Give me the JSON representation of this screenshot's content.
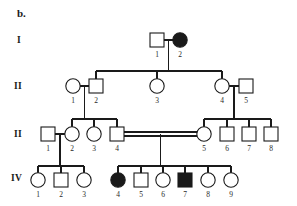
{
  "figure": {
    "panel_label": "b.",
    "type": "pedigree-chart",
    "colors": {
      "affected_fill": "#1a1a1a",
      "unaffected_fill": "#ffffff",
      "line": "#1a1a1a",
      "background": "#ffffff"
    }
  },
  "generations": [
    {
      "label": "I",
      "label_x": 17,
      "label_y": 43
    },
    {
      "label": "II",
      "label_x": 14,
      "label_y": 88
    },
    {
      "label": "II",
      "label_x": 14,
      "label_y": 136
    },
    {
      "label": "IV",
      "label_x": 12,
      "label_y": 180
    }
  ],
  "individuals": [
    {
      "id": "I-1",
      "number": "1",
      "sex": "male",
      "affected": false,
      "cx": 157,
      "cy": 40
    },
    {
      "id": "I-2",
      "number": "2",
      "sex": "female",
      "affected": true,
      "cx": 180,
      "cy": 40
    },
    {
      "id": "II-1",
      "number": "1",
      "sex": "female",
      "affected": false,
      "cx": 73,
      "cy": 86
    },
    {
      "id": "II-2",
      "number": "2",
      "sex": "male",
      "affected": false,
      "cx": 96,
      "cy": 86
    },
    {
      "id": "II-3",
      "number": "3",
      "sex": "female",
      "affected": false,
      "cx": 157,
      "cy": 86
    },
    {
      "id": "II-4",
      "number": "4",
      "sex": "female",
      "affected": false,
      "cx": 222,
      "cy": 86
    },
    {
      "id": "II-5",
      "number": "5",
      "sex": "male",
      "affected": false,
      "cx": 246,
      "cy": 86
    },
    {
      "id": "III-1",
      "number": "1",
      "sex": "male",
      "affected": false,
      "cx": 48,
      "cy": 134
    },
    {
      "id": "III-2",
      "number": "2",
      "sex": "female",
      "affected": false,
      "cx": 72,
      "cy": 134
    },
    {
      "id": "III-3",
      "number": "3",
      "sex": "female",
      "affected": false,
      "cx": 94,
      "cy": 134
    },
    {
      "id": "III-4",
      "number": "4",
      "sex": "male",
      "affected": false,
      "cx": 117,
      "cy": 134
    },
    {
      "id": "III-5",
      "number": "5",
      "sex": "female",
      "affected": false,
      "cx": 204,
      "cy": 134
    },
    {
      "id": "III-6",
      "number": "6",
      "sex": "male",
      "affected": false,
      "cx": 227,
      "cy": 134
    },
    {
      "id": "III-7",
      "number": "7",
      "sex": "male",
      "affected": false,
      "cx": 249,
      "cy": 134
    },
    {
      "id": "III-8",
      "number": "8",
      "sex": "male",
      "affected": false,
      "cx": 271,
      "cy": 134
    },
    {
      "id": "IV-1",
      "number": "1",
      "sex": "female",
      "affected": false,
      "cx": 38,
      "cy": 180
    },
    {
      "id": "IV-2",
      "number": "2",
      "sex": "male",
      "affected": false,
      "cx": 61,
      "cy": 180
    },
    {
      "id": "IV-3",
      "number": "3",
      "sex": "female",
      "affected": false,
      "cx": 84,
      "cy": 180
    },
    {
      "id": "IV-4",
      "number": "4",
      "sex": "female",
      "affected": true,
      "cx": 118,
      "cy": 180
    },
    {
      "id": "IV-5",
      "number": "5",
      "sex": "male",
      "affected": false,
      "cx": 141,
      "cy": 180
    },
    {
      "id": "IV-6",
      "number": "6",
      "sex": "female",
      "affected": false,
      "cx": 163,
      "cy": 180
    },
    {
      "id": "IV-7",
      "number": "7",
      "sex": "male",
      "affected": true,
      "cx": 185,
      "cy": 180
    },
    {
      "id": "IV-8",
      "number": "8",
      "sex": "female",
      "affected": false,
      "cx": 208,
      "cy": 180
    },
    {
      "id": "IV-9",
      "number": "9",
      "sex": "female",
      "affected": false,
      "cx": 231,
      "cy": 180
    }
  ],
  "matings": [
    {
      "id": "mating-I",
      "partners": [
        "I-1",
        "I-2"
      ],
      "consanguineous": false
    },
    {
      "id": "mating-II-12",
      "partners": [
        "II-1",
        "II-2"
      ],
      "consanguineous": false
    },
    {
      "id": "mating-II-45",
      "partners": [
        "II-4",
        "II-5"
      ],
      "consanguineous": false
    },
    {
      "id": "mating-III-23",
      "partners": [
        "III-1",
        "III-2"
      ],
      "consanguineous": false
    },
    {
      "id": "mating-III-45",
      "partners": [
        "III-4",
        "III-5"
      ],
      "consanguineous": true
    }
  ],
  "sibships": [
    {
      "id": "sibship-II",
      "parents": "mating-I",
      "children": [
        "II-1/II-2",
        "II-3",
        "II-4/II-5"
      ]
    },
    {
      "id": "sibship-III-a",
      "parents": "mating-II-12",
      "children": [
        "III-2",
        "III-3",
        "III-4"
      ]
    },
    {
      "id": "sibship-III-b",
      "parents": "mating-II-45",
      "children": [
        "III-5",
        "III-6",
        "III-7",
        "III-8"
      ]
    },
    {
      "id": "sibship-IV-a",
      "parents": "mating-III-23",
      "children": [
        "IV-1",
        "IV-2",
        "IV-3"
      ]
    },
    {
      "id": "sibship-IV-b",
      "parents": "mating-III-45",
      "children": [
        "IV-4",
        "IV-5",
        "IV-6",
        "IV-7",
        "IV-8",
        "IV-9"
      ]
    }
  ],
  "symbol_key": {
    "square": "male",
    "circle": "female",
    "filled": "affected",
    "open": "unaffected",
    "double-line": "consanguineous-mating"
  }
}
